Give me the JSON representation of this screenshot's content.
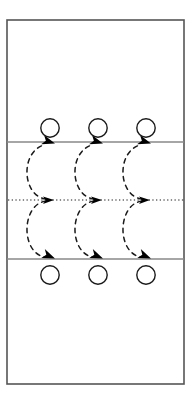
{
  "figure": {
    "type": "schematic-diagram",
    "width": 194,
    "height": 403,
    "background_color": "#ffffff"
  },
  "colors": {
    "outline": "#555555",
    "wall_line": "#888888",
    "stroke": "#1a1a1a",
    "centerline": "#1a1a1a",
    "circle_stroke": "#1a1a1a",
    "arrow_fill": "#000000",
    "background": "#ffffff"
  },
  "frame": {
    "x": 7,
    "y": 20,
    "width": 177,
    "height": 364,
    "stroke_width": 1.6
  },
  "walls": [
    {
      "id": "upper-wall",
      "y": 142,
      "x1": 7,
      "x2": 184,
      "stroke_width": 1.3
    },
    {
      "id": "lower-wall",
      "y": 259,
      "x1": 7,
      "x2": 184,
      "stroke_width": 1.3
    }
  ],
  "centerline": {
    "id": "centerline",
    "y": 200,
    "x1": 8,
    "x2": 184,
    "stroke_width": 1.2,
    "dash_pattern": "1.3 2.4"
  },
  "circles": {
    "radius": 9.2,
    "stroke_width": 1.4,
    "fill": "none",
    "upper_row": [
      {
        "cx": 50,
        "cy": 128
      },
      {
        "cx": 98,
        "cy": 128
      },
      {
        "cx": 146,
        "cy": 128
      }
    ],
    "lower_row": [
      {
        "cx": 50,
        "cy": 275
      },
      {
        "cx": 98,
        "cy": 275
      },
      {
        "cx": 146,
        "cy": 275
      }
    ]
  },
  "vortices": [
    {
      "id": "vortex-1",
      "center_x": 48
    },
    {
      "id": "vortex-2",
      "center_x": 96
    },
    {
      "id": "vortex-3",
      "center_x": 144
    }
  ],
  "streamlines": {
    "stroke_width": 1.5,
    "dash_pattern": "4.5 4.5",
    "upper_loops": [
      {
        "id": "upper-streamline-1",
        "path": "M 46 199 C 22 196 20 152 44 145"
      },
      {
        "id": "upper-streamline-2",
        "path": "M 94 199 C 70 196 68 152 92 145"
      },
      {
        "id": "upper-streamline-3",
        "path": "M 142 199 C 118 196 116 152 140 145"
      }
    ],
    "lower_loops": [
      {
        "id": "lower-streamline-1",
        "path": "M 46 201 C 22 204 20 251 44 257"
      },
      {
        "id": "lower-streamline-2",
        "path": "M 94 201 C 70 204 68 251 92 257"
      },
      {
        "id": "lower-streamline-3",
        "path": "M 142 201 C 118 204 116 251 140 257"
      }
    ]
  },
  "arrows": {
    "size": 7.5,
    "fill": "#000000",
    "upper_wall_arrows": [
      {
        "id": "arrow-upper-1",
        "x": 48,
        "y": 142,
        "angle": 18
      },
      {
        "id": "arrow-upper-2",
        "x": 96,
        "y": 142,
        "angle": 18
      },
      {
        "id": "arrow-upper-3",
        "x": 144,
        "y": 142,
        "angle": 18
      }
    ],
    "centerline_arrows": [
      {
        "id": "arrow-center-1",
        "x": 48,
        "y": 200,
        "angle": 0
      },
      {
        "id": "arrow-center-2",
        "x": 96,
        "y": 200,
        "angle": 0
      },
      {
        "id": "arrow-center-3",
        "x": 144,
        "y": 200,
        "angle": 0
      }
    ],
    "lower_wall_arrows": [
      {
        "id": "arrow-lower-1",
        "x": 48,
        "y": 259,
        "angle": 22
      },
      {
        "id": "arrow-lower-2",
        "x": 96,
        "y": 259,
        "angle": 22
      },
      {
        "id": "arrow-lower-3",
        "x": 144,
        "y": 259,
        "angle": 22
      }
    ]
  }
}
